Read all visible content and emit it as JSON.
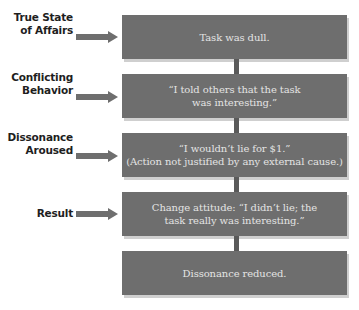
{
  "diagram": {
    "stages": [
      {
        "label_lines": [
          "True State",
          "of Affairs"
        ],
        "box_lines": [
          "Task was dull."
        ]
      },
      {
        "label_lines": [
          "Conflicting",
          "Behavior"
        ],
        "box_lines": [
          "“I told others that the task",
          "was interesting.”"
        ]
      },
      {
        "label_lines": [
          "Dissonance",
          "Aroused"
        ],
        "box_lines": [
          "“I wouldn’t lie for $1.”",
          "(Action not justified by any external cause.)"
        ]
      },
      {
        "label_lines": [
          "Result"
        ],
        "box_lines": [
          "Change attitude: “I didn’t lie; the",
          "task really was interesting.”"
        ]
      },
      {
        "label_lines": [],
        "box_lines": [
          "Dissonance reduced."
        ]
      }
    ],
    "colors": {
      "box_fill": "#6e6e6e",
      "box_text": "#e4e4e4",
      "arrow": "#6e6e6e",
      "connector": "#5a5a5a",
      "label_text": "#1e1e1e"
    }
  }
}
